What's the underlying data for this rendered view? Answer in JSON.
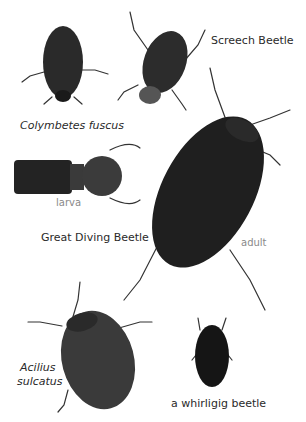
{
  "labels": {
    "colymbetes": "Colymbetes fuscus",
    "screech": "Screech Beetle",
    "larva": "larva",
    "great_diving": "Great Diving Beetle",
    "adult": "adult",
    "acilius_1": "Acilius",
    "acilius_2": "sulcatus",
    "whirligig": "a whirligig beetle"
  },
  "colors": {
    "beetle_dark": "#1e1e1e",
    "beetle_mid": "#3a3a3a",
    "label_text": "#2a2a2a",
    "label_grey": "#8a8a8a"
  }
}
